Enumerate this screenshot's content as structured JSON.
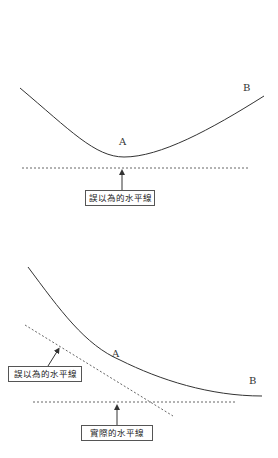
{
  "diagrams": [
    {
      "point_a": "A",
      "point_b": "B",
      "box_label": "誤以為的水平線"
    },
    {
      "point_a": "A",
      "point_b": "B",
      "box_label_wrong": "誤以為的水平線",
      "box_label_actual": "實際的水平線"
    }
  ],
  "colors": {
    "line": "#333333",
    "dashed": "#666666"
  }
}
